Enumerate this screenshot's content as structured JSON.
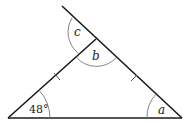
{
  "diagram": {
    "type": "geometry-triangle",
    "colors": {
      "line": "#1a1a1a",
      "arc": "#777777",
      "background": "#ffffff"
    },
    "points": {
      "left": [
        8,
        118
      ],
      "apex": [
        96,
        39
      ],
      "right": [
        182,
        118
      ],
      "extension_end": [
        62,
        6
      ]
    },
    "labels": {
      "left_angle": "48°",
      "right_angle": "a",
      "apex_interior": "b",
      "apex_exterior": "c"
    },
    "tick_marks": {
      "count": 2,
      "meaning": "equal sides"
    }
  }
}
